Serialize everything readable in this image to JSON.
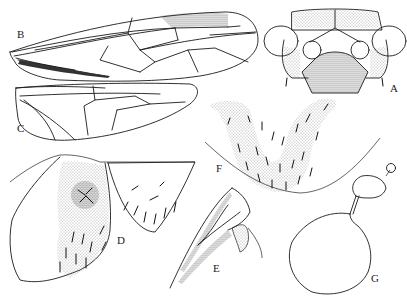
{
  "figure": {
    "type": "entomological illustration plate",
    "panels": [
      {
        "id": "A",
        "label": "A",
        "subject": "head, frontal view"
      },
      {
        "id": "B",
        "label": "B",
        "subject": "forewing"
      },
      {
        "id": "C",
        "label": "C",
        "subject": "hindwing"
      },
      {
        "id": "D",
        "label": "D",
        "subject": "abdominal plates with setae"
      },
      {
        "id": "E",
        "label": "E",
        "subject": "genital structure, lateral"
      },
      {
        "id": "F",
        "label": "F",
        "subject": "setose plate"
      },
      {
        "id": "G",
        "label": "G",
        "subject": "spermatheca"
      }
    ]
  },
  "colors": {
    "background": "#ffffff",
    "ink": "#1a1a1a",
    "stipple": "#555555"
  }
}
